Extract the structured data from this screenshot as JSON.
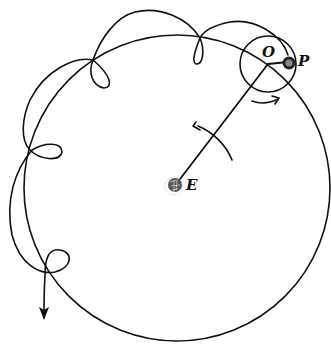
{
  "diagram": {
    "labels": {
      "center": "E",
      "epicycle_center": "O",
      "planet": "P"
    },
    "colors": {
      "ink": "#111111",
      "background": "#ffffff",
      "planet_fill": "#555555"
    },
    "elements": {
      "deferent_circle": {
        "cx": 177,
        "cy": 187,
        "r": 153
      },
      "epicycle_circle": {
        "cx": 270,
        "cy": 63,
        "r": 27
      },
      "earth": {
        "cx": 174,
        "cy": 186
      },
      "planet": {
        "cx": 289,
        "cy": 63
      },
      "radius_line": {
        "from": "E",
        "to": "O"
      },
      "rotation_arrow_deferent": "counter-clockwise",
      "rotation_arrow_epicycle": "clockwise",
      "retrograde_loops": 5
    }
  }
}
